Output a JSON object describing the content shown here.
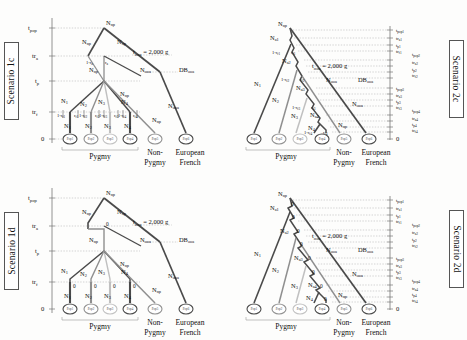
{
  "figure": {
    "background": "#fdfdfc",
    "panel_count": 4
  },
  "colors": {
    "branch_dark": "#4a4a4a",
    "branch_mid": "#8f8f8f",
    "branch_light": "#c0c0c0",
    "guide": "#b9b9b9",
    "axis": "#777777",
    "text": "#1a1a1a"
  },
  "panels": [
    {
      "id": "1c",
      "scenario_label": "Scenario 1c",
      "label_side": "left",
      "topology": "star",
      "admixture_mode": "rates",
      "time_axis": {
        "labels": [
          "t_pop",
          "tr_a",
          "t_p",
          "tr_f",
          "0"
        ],
        "display": [
          {
            "base": "t",
            "sub": "pop"
          },
          {
            "base": "tr",
            "sub": "a"
          },
          {
            "base": "t",
            "sub": "p"
          },
          {
            "base": "tr",
            "sub": "f"
          },
          {
            "base": "0",
            "sub": ""
          }
        ]
      },
      "ooa": {
        "time_label": "t_ooa = 2,000 g",
        "time_base": "t",
        "time_sub": "ooa",
        "time_value": "= 2,000 g",
        "pop_size_label": "N_ooa",
        "bottleneck_label": "DB_ooa"
      },
      "node_labels": [
        "N_np",
        "N_np",
        "N_np",
        "N_np",
        "N_np",
        "N_np",
        "N_np"
      ],
      "ancestral_size": "N_np",
      "pygmy_sizes": [
        "N_1",
        "N_2",
        "N_3",
        "N_4"
      ],
      "current_sizes": [
        "N_1",
        "N_2",
        "N_3",
        "N_4"
      ],
      "admix_rates_a": [
        "1-r_a",
        "r_a"
      ],
      "admix_rates_f": [
        "1-r_f1",
        "r_f1",
        "1-r_f2",
        "r_f2",
        "1-r_f3",
        "r_f3",
        "1-r_f4",
        "r_f4"
      ],
      "leaves": [
        "Pop1",
        "Pop2",
        "Pop3",
        "Pop4",
        "Pop5",
        "Pop6"
      ],
      "group_labels": [
        "Pygmy",
        "Non-\nPygmy",
        "European\nFrench"
      ],
      "group_pygmy": "Pygmy",
      "group_nonpygmy_line1": "Non-",
      "group_nonpygmy_line2": "Pygmy",
      "group_french_line1": "European",
      "group_french_line2": "French"
    },
    {
      "id": "2c",
      "scenario_label": "Scenario 2c",
      "label_side": "right",
      "topology": "cascade",
      "admixture_mode": "rates",
      "time_axis": {
        "groups": [
          {
            "labels": [
              "t_pop1",
              "tr_a1",
              "t_p1",
              "tr_f1"
            ]
          },
          {
            "labels": [
              "t_pop2",
              "tr_a2",
              "t_p2",
              "tr_f2"
            ]
          },
          {
            "labels": [
              "t_pop3",
              "tr_a3",
              "t_p3",
              "tr_f3"
            ]
          },
          {
            "labels": [
              "t_pop4",
              "tr_a4",
              "t_p4",
              "tr_f4"
            ]
          }
        ],
        "zero": "0"
      },
      "ooa": {
        "time_label": "t_ooa = 2,000 g",
        "time_base": "t",
        "time_sub": "ooa",
        "time_value": "= 2,000 g",
        "pop_size_label": "N_ooa",
        "bottleneck_label": "DB_ooa"
      },
      "ancestral_size": "N_np",
      "ancestral_nodes": [
        "N_a1",
        "N_a2",
        "N_a3",
        "N_a4"
      ],
      "pygmy_sizes": [
        "N_1",
        "N_2",
        "N_3",
        "N_4"
      ],
      "admix_rates_f": [
        "1-r_f1",
        "r_f1",
        "1-r_f2",
        "r_f2",
        "1-r_f3",
        "r_f3",
        "1-r_f4",
        "r_f4"
      ],
      "nonpygmy_size": "N_np",
      "leaves": [
        "Pop1",
        "Pop2",
        "Pop3",
        "Pop4",
        "Pop5",
        "Pop6"
      ],
      "group_pygmy": "Pygmy",
      "group_nonpygmy_line1": "Non-",
      "group_nonpygmy_line2": "Pygmy",
      "group_french_line1": "European",
      "group_french_line2": "French"
    },
    {
      "id": "1d",
      "scenario_label": "Scenario 1d",
      "label_side": "left",
      "topology": "star",
      "admixture_mode": "zero",
      "time_axis": {
        "labels": [
          "t_pop",
          "tr_a",
          "t_p",
          "tr_f",
          "0"
        ],
        "display": [
          {
            "base": "t",
            "sub": "pop"
          },
          {
            "base": "tr",
            "sub": "a"
          },
          {
            "base": "t",
            "sub": "p"
          },
          {
            "base": "tr",
            "sub": "f"
          },
          {
            "base": "0",
            "sub": ""
          }
        ]
      },
      "ooa": {
        "time_label": "t_ooa = 2,000 g",
        "time_base": "t",
        "time_sub": "ooa",
        "time_value": "= 2,000 g",
        "pop_size_label": "N_ooa",
        "bottleneck_label": "DB_ooa"
      },
      "ancestral_size": "N_np",
      "pygmy_sizes": [
        "N_1",
        "N_2",
        "N_3",
        "N_4"
      ],
      "current_sizes": [
        "N_1",
        "N_2",
        "N_3",
        "N_4"
      ],
      "zero_labels": [
        "0",
        "0",
        "0",
        "0",
        "0"
      ],
      "leaves": [
        "Pop1",
        "Pop2",
        "Pop3",
        "Pop4",
        "Pop5",
        "Pop6"
      ],
      "group_pygmy": "Pygmy",
      "group_nonpygmy_line1": "Non-",
      "group_nonpygmy_line2": "Pygmy",
      "group_french_line1": "European",
      "group_french_line2": "French"
    },
    {
      "id": "2d",
      "scenario_label": "Scenario 2d",
      "label_side": "right",
      "topology": "cascade",
      "admixture_mode": "zero",
      "time_axis": {
        "groups": [
          {
            "labels": [
              "t_pop1",
              "tr_a1",
              "t_p1",
              "tr_f1"
            ]
          },
          {
            "labels": [
              "t_pop2",
              "tr_a2",
              "t_p2",
              "tr_f2"
            ]
          },
          {
            "labels": [
              "t_pop3",
              "tr_a3",
              "t_p3",
              "tr_f3"
            ]
          },
          {
            "labels": [
              "t_pop4",
              "tr_a4",
              "t_p4",
              "tr_f4"
            ]
          }
        ],
        "zero": "0"
      },
      "ooa": {
        "time_label": "t_ooa = 2,000 g",
        "time_base": "t",
        "time_sub": "ooa",
        "time_value": "= 2,000 g",
        "pop_size_label": "N_ooa",
        "bottleneck_label": "DB_ooa"
      },
      "ancestral_size": "N_np",
      "ancestral_nodes": [
        "N_a1",
        "N_a2",
        "N_a3",
        "N_a4"
      ],
      "pygmy_sizes": [
        "N_1",
        "N_2",
        "N_3",
        "N_4"
      ],
      "zero_labels": [
        "0",
        "0",
        "0",
        "0",
        "0",
        "0",
        "0",
        "0"
      ],
      "nonpygmy_size": "N_np",
      "leaves": [
        "Pop1",
        "Pop2",
        "Pop3",
        "Pop4",
        "Pop5",
        "Pop6"
      ],
      "group_pygmy": "Pygmy",
      "group_nonpygmy_line1": "Non-",
      "group_nonpygmy_line2": "Pygmy",
      "group_french_line1": "European",
      "group_french_line2": "French"
    }
  ]
}
